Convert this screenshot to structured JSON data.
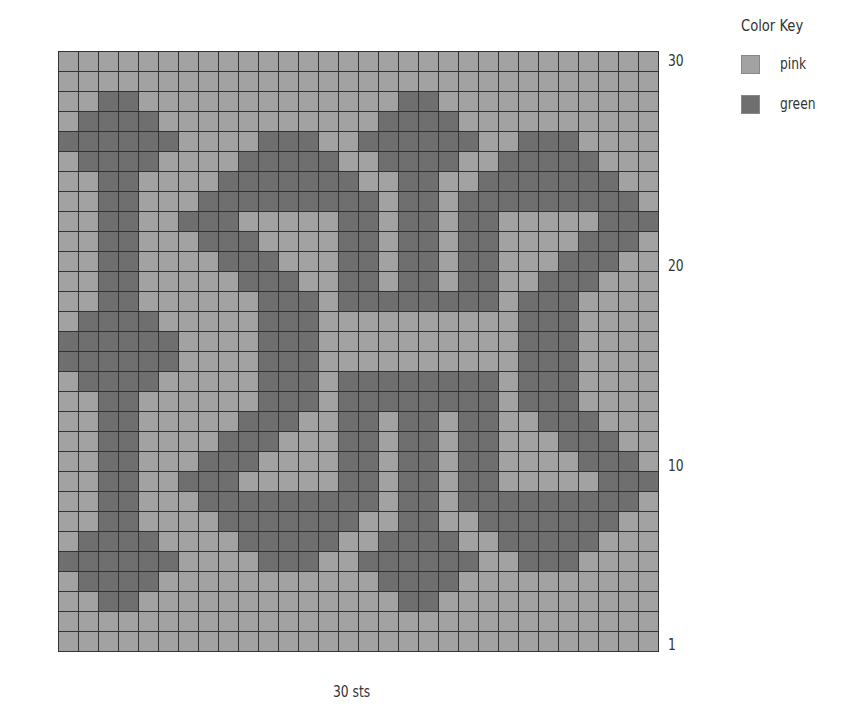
{
  "chart_data": {
    "type": "heatmap",
    "columns": 30,
    "rows": 30,
    "row_order": "top row is row 30, bottom row is row 1",
    "xlabel": "30 sts",
    "row_tick_labels": [
      {
        "row": 30,
        "label": "30"
      },
      {
        "row": 20,
        "label": "20"
      },
      {
        "row": 10,
        "label": "10"
      },
      {
        "row": 1,
        "label": "1"
      }
    ],
    "legend": [
      {
        "symbol": ".",
        "name": "pink",
        "color": "#a2a2a2"
      },
      {
        "symbol": "G",
        "name": "green",
        "color": "#6f6f6f"
      }
    ],
    "grid": [
      "..............................",
      "..............................",
      "..GG.............GG...........",
      ".GGGG...........GGGG..........",
      "GGGGGG....GGG..GGGGGG..GGG....",
      ".GGGG....GGGGG..GGGG..GGGGG...",
      "..GG....GGGGGGG..GG..GGGGGGG..",
      "..GG...GGGGGGGGG.GG.GGGGGGGGG.",
      "..GG..GGG.....GG.GG.GG.....GGG",
      "..GG...GGG....GG.GG.GG....GGG.",
      "..GG....GGG...GG.GG.GG...GGG..",
      "..GG.....GGG..GG.GG.GG..GGG...",
      "..GG......GGG.GGGGGGGG.GGG....",
      ".GGGG.....GGG..........GGG....",
      "GGGGGG....GGG..........GGG....",
      "GGGGGG....GGG..........GGG....",
      ".GGGG.....GGG.GGGGGGGG.GGG....",
      "..GG......GGG.GGGGGGGG.GGG....",
      "..GG.....GGG..GG.GG.GG..GGG...",
      "..GG....GGG...GG.GG.GG...GGG..",
      "..GG...GGG....GG.GG.GG....GGG.",
      "..GG..GGG.....GG.GG.GG.....GGG",
      "..GG...GGGGGGGGG.GG.GGGGGGGGG.",
      "..GG....GGGGGGG..GG..GGGGGGG..",
      ".GGGG....GGGGG..GGGG..GGGGG...",
      "GGGGGG....GGG..GGGGGG..GGG....",
      ".GGGG...........GGGG..........",
      "..GG.............GG...........",
      "..............................",
      ".............................."
    ]
  },
  "labels": {
    "row_30": "30",
    "row_20": "20",
    "row_10": "10",
    "row_1": "1",
    "stitch_count": "30 sts"
  },
  "key": {
    "title": "Color Key",
    "items": [
      {
        "label": "pink",
        "color": "#a2a2a2"
      },
      {
        "label": "green",
        "color": "#6f6f6f"
      }
    ]
  }
}
